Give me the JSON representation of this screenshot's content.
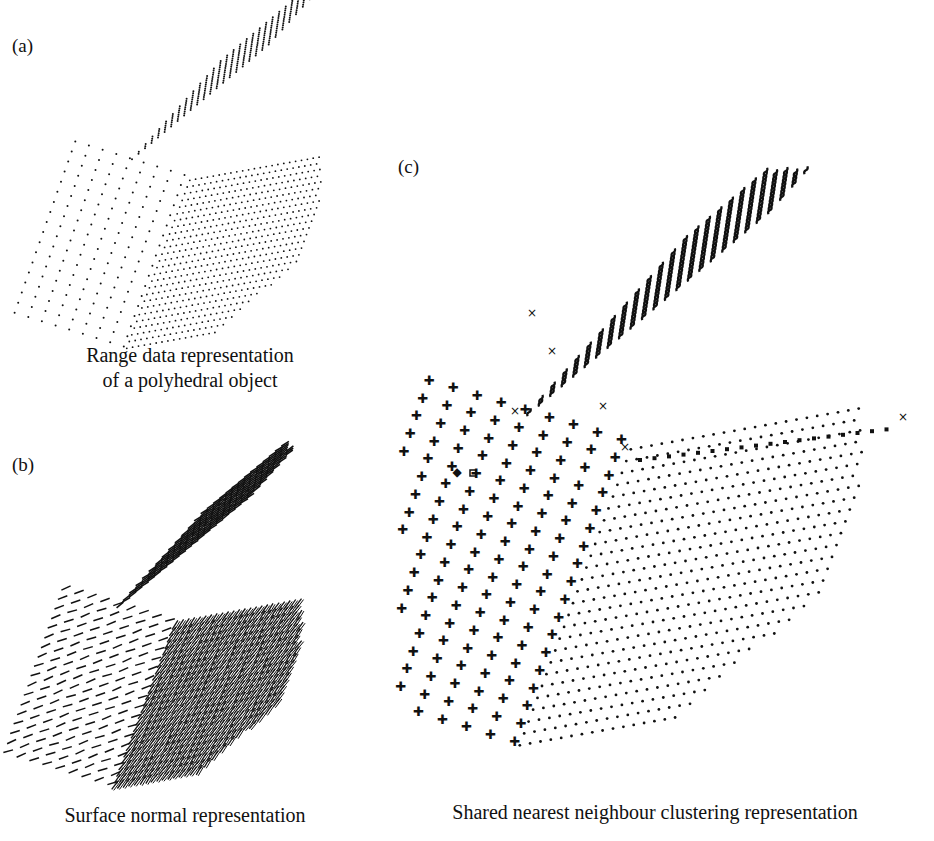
{
  "figure": {
    "panels": [
      {
        "id": "a",
        "label": "(a)",
        "caption_lines": [
          "Range data representation",
          "of a polyhedral object"
        ],
        "style": "dots"
      },
      {
        "id": "b",
        "label": "(b)",
        "caption_lines": [
          "Surface normal representation"
        ],
        "style": "normal-strokes"
      },
      {
        "id": "c",
        "label": "(c)",
        "caption_lines": [
          "Shared nearest neighbour clustering representation"
        ],
        "style": "cluster-symbols",
        "symbol_legend": {
          "left_face": "plus",
          "top_face": "squiggle",
          "bottom_right_face": "small-dot",
          "edges": "square",
          "outliers": "cross"
        }
      }
    ],
    "colors": {
      "background": "#ffffff",
      "ink": "#111111"
    }
  }
}
